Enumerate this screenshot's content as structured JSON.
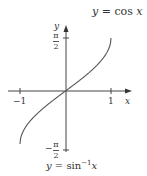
{
  "chart_data": {
    "type": "line",
    "title": "",
    "top_caption": "y = cos x",
    "caption": "y = sin⁻¹x",
    "xlabel": "x",
    "ylabel": "y",
    "xlim": [
      -1,
      1
    ],
    "ylim": [
      -1.5708,
      1.5708
    ],
    "x_ticks": [
      "-1",
      "1"
    ],
    "y_ticks": [
      "π/2",
      "-π/2"
    ],
    "series": [
      {
        "name": "y = sin⁻¹x",
        "x": [
          -1,
          -0.9,
          -0.75,
          -0.5,
          -0.25,
          0,
          0.25,
          0.5,
          0.75,
          0.9,
          1
        ],
        "values": [
          -1.5708,
          -1.1198,
          -0.8481,
          -0.5236,
          -0.2527,
          0,
          0.2527,
          0.5236,
          0.8481,
          1.1198,
          1.5708
        ]
      }
    ],
    "grid": false,
    "legend": "none",
    "colors": {
      "curve": "#555555",
      "axes": "#333333",
      "text": "#333333"
    }
  },
  "labels": {
    "top_caption_y": "y",
    "top_caption_eq": " = cos ",
    "top_caption_x": "x",
    "bottom_caption_y": "y",
    "bottom_caption_eq": " = sin",
    "bottom_caption_sup": "−1",
    "bottom_caption_x": "x",
    "axis_x": "x",
    "axis_y": "y",
    "tick_neg1": "−1",
    "tick_pos1": "1",
    "pi": "π",
    "two": "2",
    "minus": "−"
  }
}
